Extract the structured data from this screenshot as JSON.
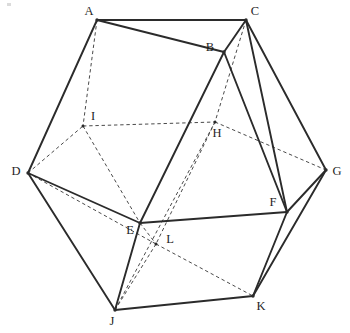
{
  "diagram": {
    "type": "3d-polyhedron-wireframe",
    "canvas": {
      "width": 350,
      "height": 333,
      "background": "#ffffff"
    },
    "style": {
      "solid_edge_color": "#2b2b2b",
      "dashed_edge_color": "#4a4a4a",
      "label_color": "#1f1f1f",
      "solid_edge_width": 1.9,
      "dashed_edge_width": 1.0
    },
    "vertices": [
      {
        "id": "A",
        "label": "A",
        "x": 97,
        "y": 20,
        "label_x": 89,
        "label_y": 12,
        "hidden": false
      },
      {
        "id": "B",
        "label": "B",
        "x": 224,
        "y": 52,
        "label_x": 210,
        "label_y": 48,
        "hidden": false
      },
      {
        "id": "C",
        "label": "C",
        "x": 246,
        "y": 20,
        "label_x": 255,
        "label_y": 12,
        "hidden": false
      },
      {
        "id": "D",
        "label": "D",
        "x": 28,
        "y": 173,
        "label_x": 16,
        "label_y": 172,
        "hidden": false
      },
      {
        "id": "E",
        "label": "E",
        "x": 140,
        "y": 223,
        "label_x": 130,
        "label_y": 231,
        "hidden": false
      },
      {
        "id": "F",
        "label": "F",
        "x": 287,
        "y": 212,
        "label_x": 273,
        "label_y": 203,
        "hidden": false
      },
      {
        "id": "G",
        "label": "G",
        "x": 326,
        "y": 170,
        "label_x": 337,
        "label_y": 172,
        "hidden": false
      },
      {
        "id": "H",
        "label": "H",
        "x": 215,
        "y": 122,
        "label_x": 217,
        "label_y": 134,
        "hidden": true
      },
      {
        "id": "I",
        "label": "I",
        "x": 83,
        "y": 126,
        "label_x": 93,
        "label_y": 117,
        "hidden": true
      },
      {
        "id": "J",
        "label": "J",
        "x": 115,
        "y": 310,
        "label_x": 112,
        "label_y": 322,
        "hidden": false
      },
      {
        "id": "K",
        "label": "K",
        "x": 253,
        "y": 296,
        "label_x": 261,
        "label_y": 307,
        "hidden": false
      },
      {
        "id": "L",
        "label": "L",
        "x": 156,
        "y": 244,
        "label_x": 170,
        "label_y": 240,
        "hidden": true
      }
    ],
    "edges_solid": [
      {
        "from": "A",
        "to": "C"
      },
      {
        "from": "A",
        "to": "B"
      },
      {
        "from": "A",
        "to": "D"
      },
      {
        "from": "B",
        "to": "C"
      },
      {
        "from": "B",
        "to": "E"
      },
      {
        "from": "B",
        "to": "F"
      },
      {
        "from": "C",
        "to": "G"
      },
      {
        "from": "C",
        "to": "F"
      },
      {
        "from": "D",
        "to": "E"
      },
      {
        "from": "D",
        "to": "J"
      },
      {
        "from": "E",
        "to": "F"
      },
      {
        "from": "E",
        "to": "J"
      },
      {
        "from": "F",
        "to": "G"
      },
      {
        "from": "F",
        "to": "K"
      },
      {
        "from": "G",
        "to": "K"
      },
      {
        "from": "J",
        "to": "K"
      }
    ],
    "edges_dashed": [
      {
        "from": "A",
        "to": "I"
      },
      {
        "from": "D",
        "to": "I"
      },
      {
        "from": "I",
        "to": "E"
      },
      {
        "from": "I",
        "to": "H"
      },
      {
        "from": "C",
        "to": "H"
      },
      {
        "from": "H",
        "to": "G"
      },
      {
        "from": "H",
        "to": "L"
      },
      {
        "from": "E",
        "to": "L"
      },
      {
        "from": "L",
        "to": "J"
      },
      {
        "from": "L",
        "to": "K"
      },
      {
        "from": "D",
        "to": "L"
      },
      {
        "from": "J",
        "to": "H"
      }
    ]
  }
}
